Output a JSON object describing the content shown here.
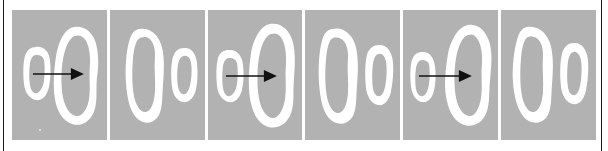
{
  "figure": {
    "background_color": "#ffffff",
    "panel_background_color": "#b2b2b2",
    "blob_color": "#ffffff",
    "arrow_color": "#111111",
    "edge_rule_color": "#1a1a1a",
    "panel_count": 6,
    "panel_gap_px": 3,
    "strip_left_px": 12,
    "strip_top_px": 10,
    "panel_width_px": 95,
    "panel_height_px": 130
  },
  "panels": [
    {
      "index": 1,
      "label": "panel-1",
      "has_arrow": true,
      "arrow_direction": "left-to-right",
      "left_blob": "small",
      "right_blob": "large",
      "has_speck": true
    },
    {
      "index": 2,
      "label": "panel-2",
      "has_arrow": false,
      "arrow_direction": "",
      "left_blob": "large",
      "right_blob": "small",
      "has_speck": false
    },
    {
      "index": 3,
      "label": "panel-3",
      "has_arrow": true,
      "arrow_direction": "left-to-right",
      "left_blob": "small",
      "right_blob": "large",
      "has_speck": false
    },
    {
      "index": 4,
      "label": "panel-4",
      "has_arrow": false,
      "arrow_direction": "",
      "left_blob": "large",
      "right_blob": "small",
      "has_speck": false
    },
    {
      "index": 5,
      "label": "panel-5",
      "has_arrow": true,
      "arrow_direction": "left-to-right",
      "left_blob": "small",
      "right_blob": "large",
      "has_speck": false
    },
    {
      "index": 6,
      "label": "panel-6",
      "has_arrow": false,
      "arrow_direction": "",
      "left_blob": "large",
      "right_blob": "small",
      "has_speck": false
    }
  ]
}
